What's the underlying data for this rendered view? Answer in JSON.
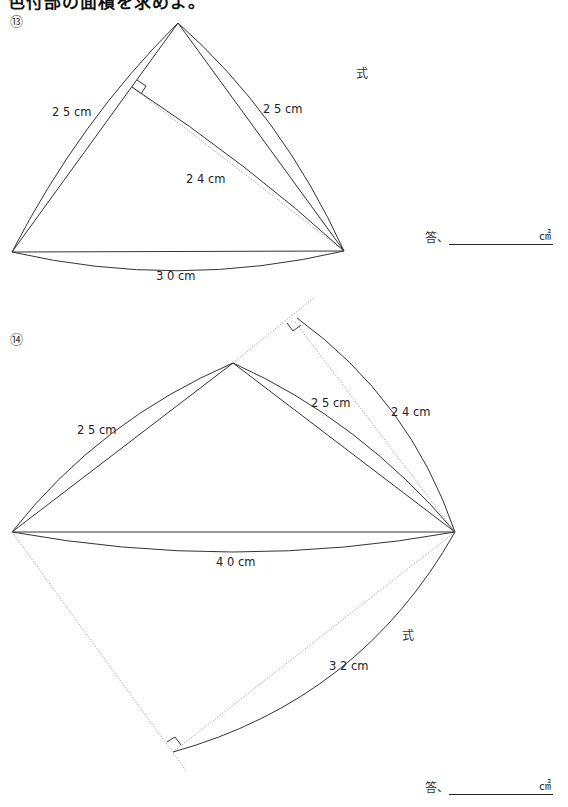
{
  "heading": "色付部の面積を求めよ。",
  "problems": [
    {
      "number": "⑬",
      "labels": {
        "left_side": "2 5 cm",
        "right_side": "2 5 cm",
        "height": "2 4 cm",
        "base": "3 0 cm"
      },
      "formula_label": "式",
      "answer_prefix": "答、",
      "answer_unit": "㎠",
      "answer_value": ""
    },
    {
      "number": "⑭",
      "labels": {
        "left_side": "2 5 cm",
        "right_side": "2 5 cm",
        "upper_height": "2 4 cm",
        "base": "4 0 cm",
        "lower_height": "3 2 cm"
      },
      "formula_label": "式",
      "answer_prefix": "答、",
      "answer_unit": "㎠",
      "answer_value": ""
    }
  ],
  "colors": {
    "stroke": "#333333",
    "guide": "#9a9a9a"
  }
}
